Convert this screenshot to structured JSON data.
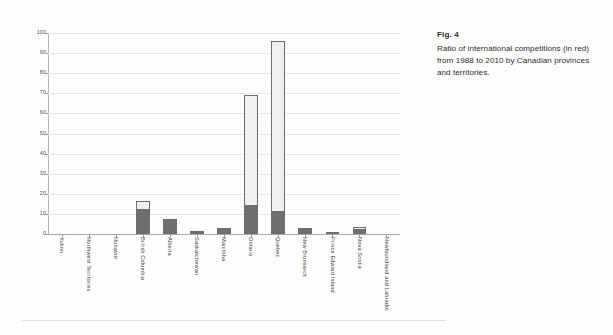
{
  "caption": {
    "title": "Fig. 4",
    "body": "Ratio of international competitions (in red) from 1988 to 2010 by Canadian provinces and territories."
  },
  "chart_data": {
    "type": "bar",
    "subtype": "stacked-bar",
    "title": "",
    "xlabel": "",
    "ylabel": "",
    "ylim": [
      0,
      100
    ],
    "yticks": [
      0,
      10,
      20,
      30,
      40,
      50,
      60,
      70,
      80,
      90,
      100
    ],
    "ytick_labels": [
      "0",
      "10",
      "20",
      "30",
      "40",
      "50",
      "60",
      "70",
      "80",
      "90",
      "100"
    ],
    "grid": true,
    "legend": "none",
    "categories": [
      "Yukon",
      "Northwest Territories",
      "Nunavut",
      "British Columbia",
      "Alberta",
      "Saskatchewan",
      "Manitoba",
      "Ontario",
      "Quebec",
      "New Brunswick",
      "Prince Edward Island",
      "Nova Scotia",
      "Newfoundland and Labrador"
    ],
    "series": [
      {
        "name": "International competitions (in red)",
        "color": "#6e6e6e",
        "values": [
          0,
          0,
          0,
          12.2,
          7.3,
          1.0,
          2.4,
          14.3,
          11.2,
          2.5,
          0.2,
          2.2,
          0
        ]
      },
      {
        "name": "Other competitions",
        "color": "#f0f0f0",
        "values": [
          0,
          0,
          0,
          4.1,
          0.0,
          0.3,
          0.4,
          54.7,
          84.8,
          0.3,
          0.9,
          1.2,
          0
        ]
      }
    ],
    "totals": [
      0,
      0,
      0,
      16.3,
      7.3,
      1.3,
      2.8,
      69.0,
      96.0,
      2.8,
      1.1,
      3.4,
      0
    ]
  },
  "colors": {
    "bar_dark": "#6e6e6e",
    "bar_light": "#f0f0f0",
    "bar_outline": "#6d6d6d",
    "gridline": "#e8e8e8",
    "axis": "#a8a8a8",
    "text": "#2b2b2b"
  }
}
